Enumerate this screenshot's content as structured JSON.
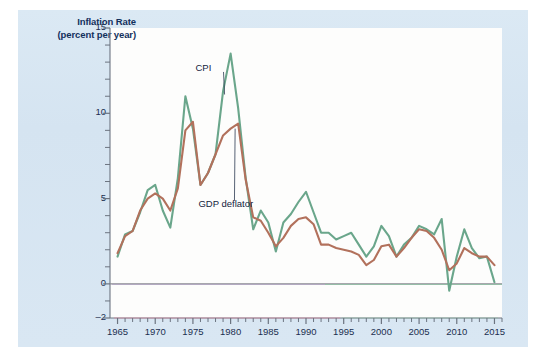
{
  "figure": {
    "panel_bg": "#d7e6f2",
    "plot_bg": "#fdfdfc",
    "axis_title_line1": "Inflation Rate",
    "axis_title_line2": "(percent per year)"
  },
  "chart_data": {
    "type": "line",
    "title": "Inflation Rate (percent per year)",
    "xlabel": "",
    "ylabel": "Inflation Rate (percent per year)",
    "xlim": [
      1964,
      2016
    ],
    "ylim": [
      -2,
      15
    ],
    "yticks": [
      -2,
      0,
      5,
      10,
      15
    ],
    "ytick_labels": [
      "–2",
      "0",
      "5",
      "10",
      "15"
    ],
    "xticks": [
      1965,
      1970,
      1975,
      1980,
      1985,
      1990,
      1995,
      2000,
      2005,
      2010,
      2015
    ],
    "xtick_labels": [
      "1965",
      "1970",
      "1975",
      "1980",
      "1985",
      "1990",
      "1995",
      "2000",
      "2005",
      "2010",
      "2015"
    ],
    "x_minor_tick_interval": 1,
    "grid": false,
    "zero_line": true,
    "zero_line_color": "#8a8a93",
    "legend_position": "inline-annotation",
    "annotations": [
      {
        "text": "CPI",
        "x": 1977.2,
        "y": 12.6,
        "leader_to_x": 1979.2,
        "leader_to_y": 11.1
      },
      {
        "text": "GDP deflator",
        "x": 1976.0,
        "y": 4.6,
        "leader_to_x": 1980.6,
        "leader_to_y": 9.1
      }
    ],
    "x": [
      1965,
      1966,
      1967,
      1968,
      1969,
      1970,
      1971,
      1972,
      1973,
      1974,
      1975,
      1976,
      1977,
      1978,
      1979,
      1980,
      1981,
      1982,
      1983,
      1984,
      1985,
      1986,
      1987,
      1988,
      1989,
      1990,
      1991,
      1992,
      1993,
      1994,
      1995,
      1996,
      1997,
      1998,
      1999,
      2000,
      2001,
      2002,
      2003,
      2004,
      2005,
      2006,
      2007,
      2008,
      2009,
      2010,
      2011,
      2012,
      2013,
      2014,
      2015
    ],
    "series": [
      {
        "name": "CPI",
        "color": "#6aa68b",
        "values": [
          1.6,
          2.9,
          3.1,
          4.2,
          5.5,
          5.8,
          4.3,
          3.3,
          6.2,
          11.0,
          9.1,
          5.8,
          6.5,
          7.6,
          11.3,
          13.5,
          10.3,
          6.2,
          3.2,
          4.3,
          3.6,
          1.9,
          3.6,
          4.1,
          4.8,
          5.4,
          4.2,
          3.0,
          3.0,
          2.6,
          2.8,
          3.0,
          2.3,
          1.6,
          2.2,
          3.4,
          2.8,
          1.6,
          2.3,
          2.7,
          3.4,
          3.2,
          2.9,
          3.8,
          -0.4,
          1.6,
          3.2,
          2.1,
          1.5,
          1.6,
          0.1
        ]
      },
      {
        "name": "GDP deflator",
        "color": "#b2715c",
        "values": [
          1.8,
          2.8,
          3.1,
          4.3,
          5.0,
          5.3,
          5.0,
          4.3,
          5.6,
          9.0,
          9.5,
          5.8,
          6.5,
          7.6,
          8.7,
          9.1,
          9.4,
          6.1,
          3.9,
          3.7,
          3.0,
          2.2,
          2.7,
          3.4,
          3.8,
          3.9,
          3.5,
          2.3,
          2.3,
          2.1,
          2.0,
          1.9,
          1.7,
          1.1,
          1.4,
          2.2,
          2.3,
          1.6,
          2.1,
          2.7,
          3.2,
          3.1,
          2.7,
          2.0,
          0.8,
          1.2,
          2.1,
          1.8,
          1.6,
          1.6,
          1.1
        ]
      }
    ]
  }
}
